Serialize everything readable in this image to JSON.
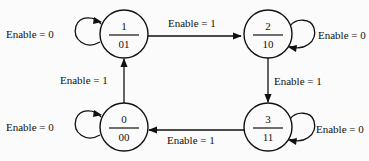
{
  "diagram": {
    "type": "state_diagram",
    "states": [
      {
        "id": "s1",
        "number": "1",
        "output": "01"
      },
      {
        "id": "s2",
        "number": "2",
        "output": "10"
      },
      {
        "id": "s3",
        "number": "3",
        "output": "11"
      },
      {
        "id": "s0",
        "number": "0",
        "output": "00"
      }
    ],
    "transitions": [
      {
        "from": "1",
        "to": "2",
        "label": "Enable = 1"
      },
      {
        "from": "2",
        "to": "3",
        "label": "Enable = 1"
      },
      {
        "from": "3",
        "to": "0",
        "label": "Enable = 1"
      },
      {
        "from": "0",
        "to": "1",
        "label": "Enable = 1"
      },
      {
        "from": "1",
        "to": "1",
        "label": "Enable = 0"
      },
      {
        "from": "2",
        "to": "2",
        "label": "Enable = 0"
      },
      {
        "from": "3",
        "to": "3",
        "label": "Enable = 0"
      },
      {
        "from": "0",
        "to": "0",
        "label": "Enable = 0"
      }
    ]
  }
}
